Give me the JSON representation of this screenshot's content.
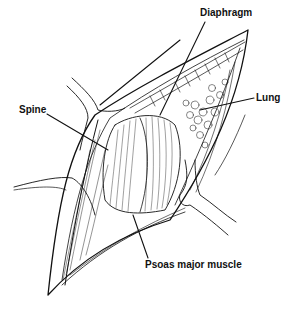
{
  "figure": {
    "type": "anatomical line illustration",
    "colors": {
      "ink": "#111111",
      "background": "#ffffff"
    },
    "labels": {
      "diaphragm": "Diaphragm",
      "lung": "Lung",
      "spine": "Spine",
      "psoas": "Psoas major muscle"
    }
  }
}
